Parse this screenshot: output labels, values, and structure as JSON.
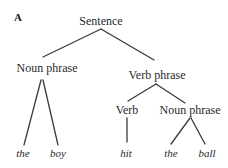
{
  "panel_label": "A",
  "tree": {
    "root": "Sentence",
    "noun_phrase_1": "Noun phrase",
    "verb_phrase": "Verb phrase",
    "verb": "Verb",
    "noun_phrase_2": "Noun phrase",
    "words": {
      "the_1": "the",
      "boy": "boy",
      "hit": "hit",
      "the_2": "the",
      "ball": "ball"
    },
    "structure": {
      "label": "Sentence",
      "children": [
        {
          "label": "Noun phrase",
          "children": [
            {
              "label": "the"
            },
            {
              "label": "boy"
            }
          ]
        },
        {
          "label": "Verb phrase",
          "children": [
            {
              "label": "Verb",
              "children": [
                {
                  "label": "hit"
                }
              ]
            },
            {
              "label": "Noun phrase",
              "children": [
                {
                  "label": "the"
                },
                {
                  "label": "ball"
                }
              ]
            }
          ]
        }
      ]
    }
  },
  "colors": {
    "line": "#3a3a3a",
    "text": "#2a2a2a",
    "background": "#ffffff"
  }
}
